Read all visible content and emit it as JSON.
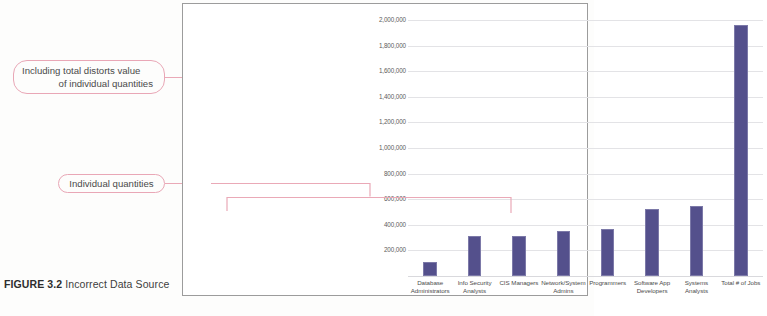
{
  "caption": {
    "figure_label": "FIGURE 3.2",
    "figure_text": " Incorrect Data Source"
  },
  "annotations": {
    "total_callout_line1": "Including total distorts value",
    "total_callout_line2": "of individual quantities",
    "individual_callout": "Individual quantities"
  },
  "colors": {
    "bar": "#54508c",
    "annotation": "#eaa9b7",
    "gridline": "#e3e3e6",
    "frame": "#9c9c9c"
  },
  "chart_data": {
    "type": "bar",
    "title": "",
    "xlabel": "",
    "ylabel": "",
    "ylim": [
      0,
      2000000
    ],
    "grid": true,
    "legend": "none",
    "categories": [
      "Database Administrators",
      "Info Security Analysts",
      "CIS Managers",
      "Network/System Admins",
      "Programmers",
      "Software App Developers",
      "Systems Analysts",
      "Total # of Jobs"
    ],
    "category_lines": [
      [
        "Database",
        "Administrators"
      ],
      [
        "Info Security",
        "Analysts"
      ],
      [
        "CIS Managers",
        ""
      ],
      [
        "Network/System",
        "Admins"
      ],
      [
        "Programmers",
        ""
      ],
      [
        "Software App",
        "Developers"
      ],
      [
        "Systems",
        "Analysts"
      ],
      [
        "Total # of Jobs",
        ""
      ]
    ],
    "values": [
      110000,
      310000,
      310000,
      355000,
      370000,
      520000,
      545000,
      1960000
    ],
    "yticks": [
      200000,
      400000,
      600000,
      800000,
      1000000,
      1200000,
      1400000,
      1600000,
      1800000,
      2000000
    ],
    "ytick_labels": [
      "200,000",
      "400,000",
      "600,000",
      "800,000",
      "1,000,000",
      "1,200,000",
      "1,400,000",
      "1,600,000",
      "1,800,000",
      "2,000,000"
    ]
  }
}
